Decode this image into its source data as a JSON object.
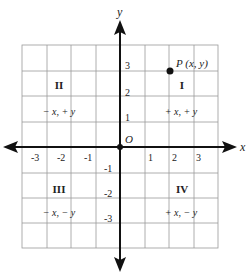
{
  "diagram": {
    "axes": {
      "x_label": "x",
      "y_label": "y",
      "origin_label": "O",
      "x_ticks": [
        "-3",
        "-2",
        "-1",
        "1",
        "2",
        "3"
      ],
      "y_ticks": [
        "3",
        "2",
        "1",
        "-1",
        "-2",
        "-3"
      ],
      "range": [
        -4,
        4
      ]
    },
    "point": {
      "label": "P (x, y)",
      "x": 2,
      "y": 3
    },
    "quadrants": [
      {
        "numeral": "I",
        "signs": "+ x, + y"
      },
      {
        "numeral": "II",
        "signs": "− x, + y"
      },
      {
        "numeral": "III",
        "signs": "− x, − y"
      },
      {
        "numeral": "IV",
        "signs": "+ x, − y"
      }
    ],
    "colors": {
      "grid": "#9a9a9a",
      "axis": "#111111",
      "text": "#222222"
    }
  }
}
